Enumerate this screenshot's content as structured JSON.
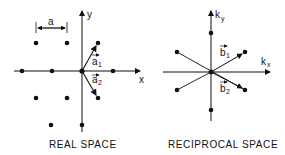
{
  "left_panel": {
    "caption": "REAL SPACE",
    "axis_x_label": "x",
    "axis_y_label": "y",
    "lattice_constant_label": "a",
    "vector_1_label": "a1",
    "vector_2_label": "a2",
    "vector_1_base": "a",
    "vector_1_sub": "1",
    "vector_2_base": "a",
    "vector_2_sub": "2"
  },
  "right_panel": {
    "caption": "RECIPROCAL SPACE",
    "axis_x_label": "k",
    "axis_x_sub": "x",
    "axis_y_label": "k",
    "axis_y_sub": "y",
    "vector_1_base": "b",
    "vector_1_sub": "1",
    "vector_2_base": "b",
    "vector_2_sub": "2"
  },
  "colors": {
    "ink": "#111111",
    "background": "#ffffff"
  }
}
